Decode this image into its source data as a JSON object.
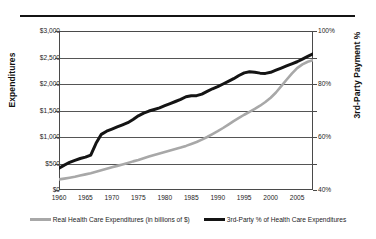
{
  "figure": {
    "top_rule": "",
    "faded_header_text": "",
    "left_axis_title": "Expenditures",
    "right_axis_title": "3rd-Party Payment %"
  },
  "legend": {
    "entries": [
      {
        "label": "Real Health Care Expenditures  (in billions of $)",
        "color": "#a8a8a8",
        "marker": "line-swatch-gray"
      },
      {
        "label": "3rd-Party % of Health Care Expenditures",
        "color": "#141414",
        "marker": "line-swatch-black"
      }
    ]
  },
  "chart_data": {
    "type": "line",
    "title": "",
    "xlabel": "",
    "grid": true,
    "legend_position": "bottom",
    "x": [
      1960,
      1961,
      1962,
      1963,
      1964,
      1965,
      1966,
      1967,
      1968,
      1969,
      1970,
      1971,
      1972,
      1973,
      1974,
      1975,
      1976,
      1977,
      1978,
      1979,
      1980,
      1981,
      1982,
      1983,
      1984,
      1985,
      1986,
      1987,
      1988,
      1989,
      1990,
      1991,
      1992,
      1993,
      1994,
      1995,
      1996,
      1997,
      1998,
      1999,
      2000,
      2001,
      2002,
      2003,
      2004,
      2005,
      2006,
      2007,
      2008
    ],
    "xticks": [
      1960,
      1965,
      1970,
      1975,
      1980,
      1985,
      1990,
      1995,
      2000,
      2005
    ],
    "xlim": [
      1960,
      2008
    ],
    "axes": [
      {
        "id": "left",
        "label": "Expenditures",
        "ylim": [
          0,
          3000
        ],
        "yticks": [
          0,
          500,
          1000,
          1500,
          2000,
          2500,
          3000
        ],
        "yticklabels": [
          "$0",
          "$500",
          "$1,000",
          "$1,500",
          "$2,000",
          "$2,500",
          "$3,000"
        ]
      },
      {
        "id": "right",
        "label": "3rd-Party Payment %",
        "ylim": [
          40,
          100
        ],
        "yticks": [
          40,
          50,
          60,
          70,
          80,
          90,
          100
        ],
        "yticklabels": [
          "40%",
          "",
          "60%",
          "",
          "80%",
          "",
          "100%"
        ]
      }
    ],
    "series": [
      {
        "name": "Real Health Care Expenditures  (in billions of $)",
        "axis": "left",
        "color": "#a8a8a8",
        "linewidth": 2.6,
        "unit": "billions of $",
        "values": [
          200,
          215,
          232,
          250,
          272,
          295,
          318,
          345,
          372,
          400,
          430,
          455,
          482,
          510,
          540,
          566,
          600,
          632,
          662,
          690,
          718,
          745,
          772,
          800,
          832,
          868,
          905,
          950,
          1000,
          1055,
          1110,
          1170,
          1235,
          1300,
          1360,
          1420,
          1475,
          1530,
          1590,
          1660,
          1740,
          1840,
          1960,
          2080,
          2195,
          2300,
          2370,
          2420,
          2450
        ]
      },
      {
        "name": "3rd-Party % of Health Care Expenditures",
        "axis": "right",
        "color": "#141414",
        "linewidth": 3.0,
        "unit": "percent",
        "values": [
          48.2,
          49.4,
          50.4,
          51.2,
          51.9,
          52.4,
          53.2,
          57.6,
          61.0,
          62.2,
          63.0,
          63.8,
          64.6,
          65.4,
          66.6,
          68.0,
          69.0,
          69.8,
          70.4,
          71.0,
          71.8,
          72.6,
          73.4,
          74.2,
          75.2,
          75.6,
          75.6,
          76.2,
          77.2,
          78.2,
          79.0,
          80.0,
          81.0,
          82.0,
          83.2,
          84.2,
          84.6,
          84.4,
          84.1,
          84.0,
          84.4,
          85.2,
          86.0,
          86.8,
          87.6,
          88.4,
          89.4,
          90.4,
          91.4
        ]
      }
    ]
  }
}
